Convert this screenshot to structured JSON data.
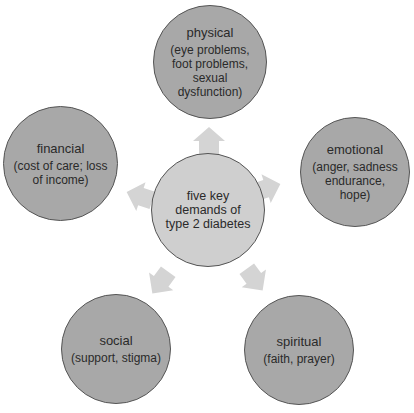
{
  "diagram": {
    "type": "hub-and-spoke",
    "colors": {
      "outer_fill": "#a8a8a8",
      "center_fill": "#cfcfcf",
      "stroke": "#555555",
      "arrow": "#d4d4d4",
      "text": "#2a2a2a"
    },
    "center": {
      "title": "five key demands of type 2 diabetes"
    },
    "nodes": [
      {
        "id": "physical",
        "title": "physical",
        "detail": "(eye problems, foot problems, sexual dysfunction)"
      },
      {
        "id": "emotional",
        "title": "emotional",
        "detail": "(anger, sadness endurance, hope)"
      },
      {
        "id": "spiritual",
        "title": "spiritual",
        "detail": "(faith, prayer)"
      },
      {
        "id": "social",
        "title": "social",
        "detail": "(support, stigma)"
      },
      {
        "id": "financial",
        "title": "financial",
        "detail": "(cost of care; loss of income)"
      }
    ],
    "arrows": [
      {
        "from": "center",
        "to": "physical",
        "icon": "arrow-up-icon"
      },
      {
        "from": "center",
        "to": "emotional",
        "icon": "arrow-right-icon"
      },
      {
        "from": "center",
        "to": "spiritual",
        "icon": "arrow-down-right-icon"
      },
      {
        "from": "center",
        "to": "social",
        "icon": "arrow-down-left-icon"
      },
      {
        "from": "center",
        "to": "financial",
        "icon": "arrow-left-icon"
      }
    ]
  }
}
